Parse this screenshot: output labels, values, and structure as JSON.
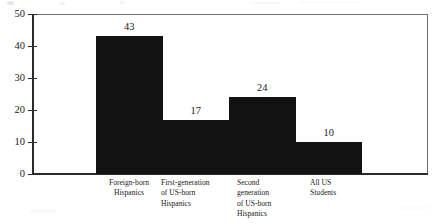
{
  "chart_data": {
    "type": "bar",
    "title": "",
    "subtitle": "",
    "xlabel": "",
    "ylabel": "",
    "ylim": [
      0,
      50
    ],
    "yticks": [
      "0",
      "10",
      "20",
      "30",
      "40",
      "50"
    ],
    "grid": false,
    "legend": null,
    "categories": [
      "Foreign-born\nHispanics",
      "First-generation\n of US-born\nHispanics",
      "   Second\ngeneration\nof US-born\nHispanics",
      "All US\nStudents"
    ],
    "values": [
      43,
      17,
      24,
      10
    ],
    "value_labels": [
      "43",
      "17",
      "24",
      "10"
    ]
  },
  "figure": {
    "background_color": "#ffffff",
    "bar_color": "#121212",
    "axis_color": "#2b2b2b",
    "frame_color": "#6f6f6f",
    "text_color": "#1a1a1a"
  }
}
